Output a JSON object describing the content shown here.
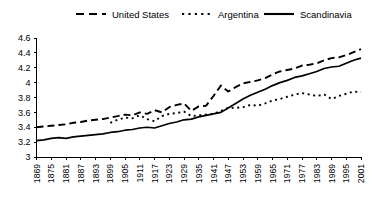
{
  "chart_data": {
    "type": "line",
    "title": "",
    "subtitle": "",
    "xlabel": "",
    "ylabel": "",
    "grid": false,
    "legend_position": "top",
    "xlim": [
      1869,
      2001
    ],
    "ylim": [
      3.0,
      4.6
    ],
    "y_ticks": [
      "3",
      "3.2",
      "3.4",
      "3.6",
      "3.8",
      "4",
      "4.2",
      "4.4",
      "4.6"
    ],
    "y_tick_values": [
      3.0,
      3.2,
      3.4,
      3.6,
      3.8,
      4.0,
      4.2,
      4.4,
      4.6
    ],
    "x_ticks": [
      "1869",
      "1875",
      "1881",
      "1887",
      "1893",
      "1899",
      "1905",
      "1911",
      "1917",
      "1923",
      "1929",
      "1935",
      "1941",
      "1947",
      "1953",
      "1959",
      "1965",
      "1971",
      "1977",
      "1983",
      "1989",
      "1995",
      "2001"
    ],
    "x_tick_values": [
      1869,
      1875,
      1881,
      1887,
      1893,
      1899,
      1905,
      1911,
      1917,
      1923,
      1929,
      1935,
      1941,
      1947,
      1953,
      1959,
      1965,
      1971,
      1977,
      1983,
      1989,
      1995,
      2001
    ],
    "series": [
      {
        "name": "United States",
        "style": "dashed",
        "color": "#000000",
        "x": [
          1869,
          1872,
          1875,
          1878,
          1881,
          1884,
          1887,
          1890,
          1893,
          1896,
          1899,
          1902,
          1905,
          1908,
          1911,
          1914,
          1917,
          1920,
          1923,
          1926,
          1929,
          1932,
          1935,
          1938,
          1941,
          1944,
          1947,
          1950,
          1953,
          1956,
          1959,
          1962,
          1965,
          1968,
          1971,
          1974,
          1977,
          1980,
          1983,
          1986,
          1989,
          1992,
          1995,
          1998,
          2001
        ],
        "y": [
          3.4,
          3.41,
          3.42,
          3.43,
          3.44,
          3.46,
          3.47,
          3.49,
          3.5,
          3.51,
          3.53,
          3.55,
          3.57,
          3.56,
          3.6,
          3.58,
          3.63,
          3.6,
          3.67,
          3.7,
          3.72,
          3.62,
          3.68,
          3.69,
          3.82,
          3.96,
          3.88,
          3.94,
          3.99,
          4.01,
          4.03,
          4.06,
          4.11,
          4.15,
          4.17,
          4.19,
          4.23,
          4.24,
          4.26,
          4.3,
          4.33,
          4.34,
          4.37,
          4.41,
          4.45
        ]
      },
      {
        "name": "Argentina",
        "style": "dotted",
        "color": "#000000",
        "x": [
          1899,
          1902,
          1905,
          1908,
          1911,
          1914,
          1917,
          1920,
          1923,
          1926,
          1929,
          1932,
          1935,
          1938,
          1941,
          1944,
          1947,
          1950,
          1953,
          1956,
          1959,
          1962,
          1965,
          1968,
          1971,
          1974,
          1977,
          1980,
          1983,
          1986,
          1989,
          1992,
          1995,
          1998,
          2001
        ],
        "y": [
          3.46,
          3.5,
          3.53,
          3.52,
          3.56,
          3.51,
          3.48,
          3.55,
          3.58,
          3.59,
          3.61,
          3.55,
          3.56,
          3.57,
          3.58,
          3.62,
          3.66,
          3.66,
          3.67,
          3.7,
          3.69,
          3.72,
          3.76,
          3.78,
          3.81,
          3.84,
          3.86,
          3.84,
          3.82,
          3.84,
          3.78,
          3.82,
          3.85,
          3.88,
          3.87
        ]
      },
      {
        "name": "Scandinavia",
        "style": "solid",
        "color": "#000000",
        "x": [
          1869,
          1872,
          1875,
          1878,
          1881,
          1884,
          1887,
          1890,
          1893,
          1896,
          1899,
          1902,
          1905,
          1908,
          1911,
          1914,
          1917,
          1920,
          1923,
          1926,
          1929,
          1932,
          1935,
          1938,
          1941,
          1944,
          1947,
          1950,
          1953,
          1956,
          1959,
          1962,
          1965,
          1968,
          1971,
          1974,
          1977,
          1980,
          1983,
          1986,
          1989,
          1992,
          1995,
          1998,
          2001
        ],
        "y": [
          3.22,
          3.23,
          3.25,
          3.26,
          3.25,
          3.27,
          3.28,
          3.29,
          3.3,
          3.31,
          3.33,
          3.34,
          3.36,
          3.37,
          3.39,
          3.4,
          3.39,
          3.42,
          3.45,
          3.47,
          3.5,
          3.51,
          3.54,
          3.56,
          3.58,
          3.6,
          3.66,
          3.72,
          3.78,
          3.83,
          3.87,
          3.91,
          3.96,
          4.0,
          4.03,
          4.07,
          4.09,
          4.12,
          4.15,
          4.19,
          4.21,
          4.22,
          4.26,
          4.3,
          4.33
        ]
      }
    ],
    "legend": [
      {
        "label": "United States",
        "style": "dashed"
      },
      {
        "label": "Argentina",
        "style": "dotted"
      },
      {
        "label": "Scandinavia",
        "style": "solid"
      }
    ]
  }
}
